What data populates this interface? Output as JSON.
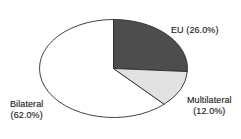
{
  "chart_data": {
    "type": "pie",
    "title": "",
    "subtitle": "",
    "xlabel": "",
    "ylabel": "",
    "legend_position": "none",
    "grid": false,
    "labels_inline": true,
    "start_angle_deg": 0,
    "direction": "clockwise",
    "categories": [
      "EU",
      "Multilateral",
      "Bilateral"
    ],
    "values": [
      26.0,
      12.0,
      62.0
    ],
    "value_unit": "%",
    "slices": [
      {
        "name": "EU",
        "value": 26.0,
        "label": "EU (26.0%)",
        "label_lines": [
          "EU (26.0%)"
        ],
        "color": "#4d4d4d",
        "outline_color": "#2c2c2c"
      },
      {
        "name": "Multilateral",
        "value": 12.0,
        "label": "Multilateral (12.0%)",
        "label_lines": [
          "Multilateral",
          "(12.0%)"
        ],
        "color": "#e2e2e2",
        "outline_color": "#2c2c2c"
      },
      {
        "name": "Bilateral",
        "value": 62.0,
        "label": "Bilateral (62.0%)",
        "label_lines": [
          "Bilateral",
          "(62.0%)"
        ],
        "color": "#ffffff",
        "outline_color": "#2c2c2c"
      }
    ],
    "background_color": "#ffffff",
    "geometry": {
      "center_x": 113.5,
      "center_y": 68.5,
      "radius_x": 74,
      "radius_y": 49
    }
  },
  "labels": {
    "eu": {
      "line1": "EU (26.0%)"
    },
    "multilateral": {
      "line1": "Multilateral",
      "line2": "(12.0%)"
    },
    "bilateral": {
      "line1": "Bilateral",
      "line2": "(62.0%)"
    }
  }
}
